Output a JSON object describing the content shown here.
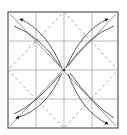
{
  "diagram": {
    "colors": {
      "frame": "#555555",
      "grid": "#888888",
      "dashed": "#9a9a9a",
      "arrow": "#333333",
      "background": "#ffffff"
    },
    "elements": [
      "square frame",
      "4x4 crease grid",
      "dashed diamond valley folds",
      "curved fold arrows to each corner"
    ]
  }
}
